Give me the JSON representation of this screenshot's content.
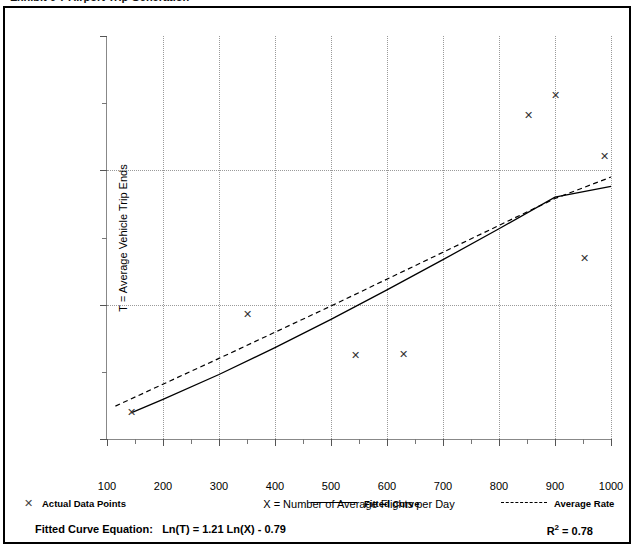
{
  "page": {
    "clipped_top_caption": "Exhibit 6-7  Airport Trip Generation"
  },
  "chart_data": {
    "type": "scatter",
    "title": "",
    "xlabel": "X = Number of Average Flights per Day",
    "ylabel": "T = Average Vehicle Trip Ends",
    "xlim": [
      100,
      1000
    ],
    "ylim": [
      0,
      3000
    ],
    "x_ticks": [
      100,
      200,
      300,
      400,
      500,
      600,
      700,
      800,
      900,
      1000
    ],
    "x_tick_labels": [
      "100",
      "200",
      "300",
      "400",
      "500",
      "600",
      "700",
      "800",
      "900",
      "1000"
    ],
    "x_minor_step": 50,
    "y_ticks": [
      0,
      1000,
      2000,
      3000
    ],
    "y_tick_labels": [
      "0",
      "1,000",
      "2,000",
      "3,000"
    ],
    "y_minor_step": 500,
    "grid": "dotted vertical at major x ticks, dotted horizontal at major y ticks",
    "legend_position": "below plot",
    "series": [
      {
        "name": "Actual Data Points",
        "type": "scatter",
        "marker": "x",
        "points": [
          {
            "x": 143,
            "y": 195
          },
          {
            "x": 350,
            "y": 930
          },
          {
            "x": 543,
            "y": 625
          },
          {
            "x": 629,
            "y": 632
          },
          {
            "x": 853,
            "y": 2405
          },
          {
            "x": 900,
            "y": 2555
          },
          {
            "x": 952,
            "y": 1340
          },
          {
            "x": 988,
            "y": 2100
          }
        ]
      },
      {
        "name": "Fitted Curve",
        "type": "line",
        "style": "solid",
        "points": [
          {
            "x": 143,
            "y": 195
          },
          {
            "x": 200,
            "y": 295
          },
          {
            "x": 300,
            "y": 480
          },
          {
            "x": 400,
            "y": 680
          },
          {
            "x": 500,
            "y": 890
          },
          {
            "x": 600,
            "y": 1110
          },
          {
            "x": 700,
            "y": 1335
          },
          {
            "x": 800,
            "y": 1565
          },
          {
            "x": 900,
            "y": 1800
          },
          {
            "x": 1000,
            "y": 1880
          }
        ]
      },
      {
        "name": "Average Rate",
        "type": "line",
        "style": "dashed",
        "points": [
          {
            "x": 115,
            "y": 245
          },
          {
            "x": 300,
            "y": 600
          },
          {
            "x": 500,
            "y": 990
          },
          {
            "x": 700,
            "y": 1390
          },
          {
            "x": 900,
            "y": 1790
          },
          {
            "x": 1000,
            "y": 1950
          }
        ]
      }
    ],
    "annotations": {
      "equation_label": "Fitted Curve Equation:",
      "equation": "Ln(T) = 1.21 Ln(X) - 0.79",
      "r_squared": "R",
      "r_squared_exp": "2",
      "r_squared_value": " = 0.78"
    }
  },
  "legend": {
    "items": [
      {
        "label": "Actual Data Points",
        "marker": "cross"
      },
      {
        "label": "Fitted Curve",
        "marker": "solid"
      },
      {
        "label": "Average Rate",
        "marker": "dashed"
      }
    ]
  },
  "colors": {
    "frame": "#000000",
    "axis": "#888888",
    "grid": "#9a9a9a",
    "marker": "#333333",
    "line": "#000000"
  }
}
